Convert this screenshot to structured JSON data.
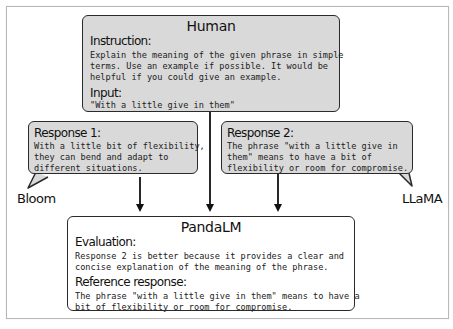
{
  "human": {
    "title": "Human",
    "instruction_label": "Instruction:",
    "instruction_text": "Explain the meaning of the given phrase in simple\nterms. Use an example if possible. It would be\nhelpful if you could give an example.",
    "input_label": "Input:",
    "input_text": "\"With a little give in them\""
  },
  "response1": {
    "label": "Response 1:",
    "text": "With a little bit of flexibility,\nthey can bend and adapt to\ndifferent situations.",
    "model": "Bloom"
  },
  "response2": {
    "label": "Response 2:",
    "text": "The phrase \"with a little give in\nthem\" means to have a bit of\nflexibility or room for compromise.",
    "model": "LLaMA"
  },
  "pandalm": {
    "title": "PandaLM",
    "evaluation_label": "Evaluation:",
    "evaluation_text": "Response 2 is better because it provides a clear and\nconcise explanation of the meaning of the phrase.",
    "reference_label": "Reference response:",
    "reference_text": "The phrase \"with a little give in them\" means to have a\nbit of flexibility or room for compromise."
  },
  "colors": {
    "box_gray": "#d9d9d9",
    "stroke": "#2a2a2a"
  }
}
